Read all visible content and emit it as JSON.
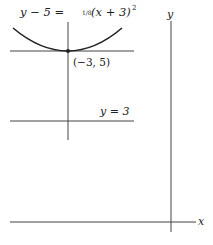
{
  "diagram": {
    "equation": {
      "lhs": "y − 5 = ",
      "frac": "1/8",
      "rhs": "(x + 3)",
      "exp": "2"
    },
    "vertex_label": "(−3, 5)",
    "directrix_label": "y = 3",
    "axis_labels": {
      "x": "x",
      "y": "y"
    },
    "colors": {
      "line": "#222222",
      "background": "#ffffff"
    }
  }
}
